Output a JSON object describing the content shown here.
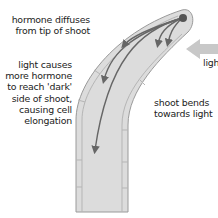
{
  "diagram": {
    "labels": {
      "hormone": "hormone diffuses\nfrom tip of shoot",
      "light_effect": "light causes\nmore hormone\nto reach 'dark'\nside of shoot,\ncausing cell\nelongation",
      "bend": "shoot bends\ntowards light",
      "light": "light"
    },
    "colors": {
      "shoot_fill": "#dcdcdc",
      "shoot_edge": "#9a9a9a",
      "cell_wall": "#b5b5b5",
      "arrow": "#666666",
      "tip_dot": "#555555",
      "light_arrow": "#c8c8c8",
      "text": "#222222"
    },
    "icons": [
      "hormone-flow-arrow",
      "light-arrow",
      "shoot-tip-dot"
    ]
  }
}
